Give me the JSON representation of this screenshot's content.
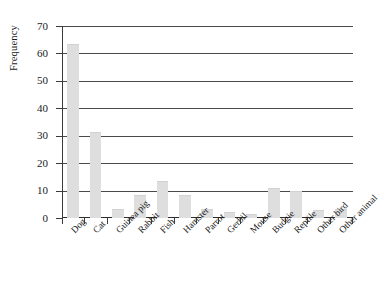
{
  "chart_data": {
    "type": "bar",
    "title": "",
    "subtitle": "",
    "xlabel": "",
    "ylabel": "Frequency",
    "ylim": [
      0,
      70
    ],
    "ytick_step": 10,
    "yticks": [
      0,
      10,
      20,
      30,
      40,
      50,
      60,
      70
    ],
    "grid": "horizontal",
    "legend": "none",
    "bar_color": "#dedede",
    "axis_color": "#3a3a3a",
    "categories": [
      "Dog",
      "Cat",
      "Guinea pig",
      "Rabbit",
      "Fish",
      "Hamster",
      "Parrot",
      "Gerbil",
      "Mouse",
      "Budgie",
      "Reptile",
      "Other bird",
      "Other animal"
    ],
    "values": [
      63,
      31,
      3,
      8,
      13,
      8,
      3,
      2,
      1,
      10.5,
      9.5,
      2.5,
      3
    ]
  }
}
